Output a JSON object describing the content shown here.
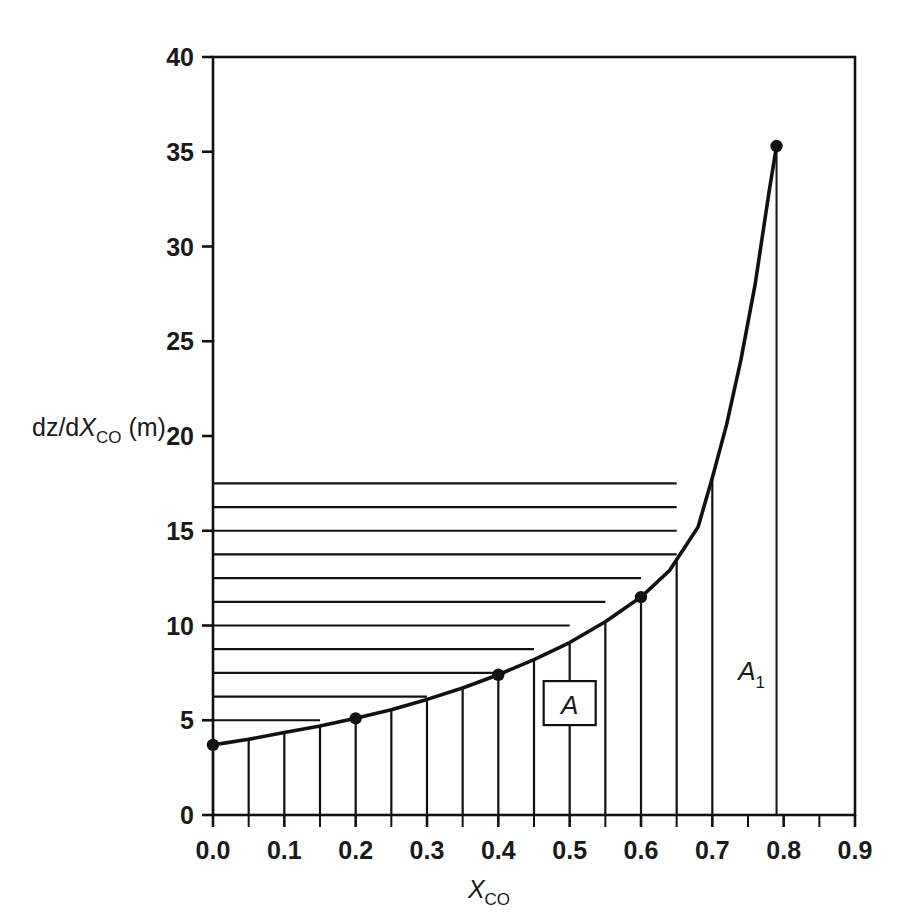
{
  "chart_data": {
    "type": "line",
    "title": "",
    "xlabel": "X_CO",
    "xlabel_main": "X",
    "xlabel_sub": "CO",
    "ylabel": "dz/dX_CO (m)",
    "ylabel_pre": "dz/d",
    "ylabel_ital": "X",
    "ylabel_sub": "CO",
    "ylabel_post": "(m)",
    "xlim": [
      0.0,
      0.9
    ],
    "ylim": [
      0,
      40
    ],
    "grid": true,
    "legend_position": "none",
    "xticks": [
      "0.0",
      "0.1",
      "0.2",
      "0.3",
      "0.4",
      "0.5",
      "0.6",
      "0.7",
      "0.8",
      "0.9"
    ],
    "xtick_values": [
      0.0,
      0.1,
      0.2,
      0.3,
      0.4,
      0.5,
      0.6,
      0.7,
      0.8,
      0.9
    ],
    "xminor_step": 0.05,
    "yticks": [
      "0",
      "5",
      "10",
      "15",
      "20",
      "25",
      "30",
      "35",
      "40"
    ],
    "ytick_values": [
      0,
      5,
      10,
      15,
      20,
      25,
      30,
      35,
      40
    ],
    "series": [
      {
        "name": "dz/dXCO",
        "markers_x": [
          0.0,
          0.2,
          0.4,
          0.6,
          0.79
        ],
        "markers_y": [
          3.7,
          5.1,
          7.4,
          11.5,
          35.3
        ],
        "x": [
          0.0,
          0.05,
          0.1,
          0.15,
          0.2,
          0.25,
          0.3,
          0.35,
          0.4,
          0.45,
          0.5,
          0.55,
          0.6,
          0.64,
          0.68,
          0.7,
          0.72,
          0.74,
          0.76,
          0.78,
          0.79
        ],
        "y": [
          3.7,
          4.0,
          4.35,
          4.7,
          5.1,
          5.55,
          6.1,
          6.7,
          7.4,
          8.2,
          9.1,
          10.2,
          11.5,
          12.9,
          15.2,
          17.8,
          20.6,
          24.0,
          28.0,
          33.0,
          35.3
        ]
      }
    ],
    "hatch_region": {
      "label": "A",
      "x_start": 0.0,
      "x_end": 0.7,
      "vline_step": 0.05,
      "hline_step": 1.25,
      "description": "cross-hatched area under curve between XCO = 0.0 and 0.7"
    },
    "annotations": [
      {
        "name": "area-A",
        "text": "A",
        "x": 0.5,
        "y": 5.8,
        "boxed": true
      },
      {
        "name": "area-A1",
        "text": "A",
        "subscript": "1",
        "x": 0.755,
        "y": 7.6,
        "boxed": false
      }
    ],
    "dropline": {
      "x": 0.79,
      "y_top": 35.3,
      "y_bottom": 0
    }
  }
}
